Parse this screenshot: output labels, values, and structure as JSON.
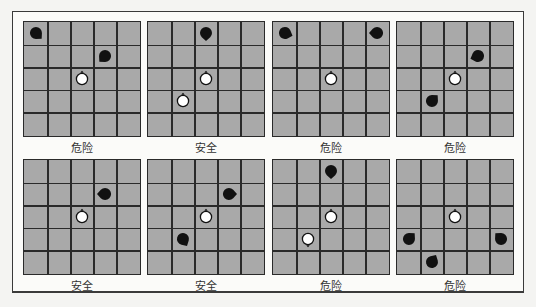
{
  "figure": {
    "grid_size": 5,
    "colors": {
      "board": "#a9a9a9",
      "grid_line": "#2a2a2a",
      "black_piece": "#111111",
      "white_piece": "#ffffff",
      "label_text": "#333333"
    },
    "panels": [
      {
        "label": "危险",
        "pieces": [
          {
            "color": "black",
            "row": 0,
            "col": 0,
            "dir": 135
          },
          {
            "color": "black",
            "row": 1,
            "col": 3,
            "dir": 225
          },
          {
            "color": "white",
            "row": 2,
            "col": 2,
            "dir": 0
          }
        ]
      },
      {
        "label": "安全",
        "pieces": [
          {
            "color": "black",
            "row": 0,
            "col": 2,
            "dir": 180
          },
          {
            "color": "white",
            "row": 2,
            "col": 2,
            "dir": 0
          },
          {
            "color": "white",
            "row": 3,
            "col": 1,
            "dir": 0
          }
        ]
      },
      {
        "label": "危险",
        "pieces": [
          {
            "color": "black",
            "row": 0,
            "col": 0,
            "dir": 110
          },
          {
            "color": "black",
            "row": 0,
            "col": 4,
            "dir": 270
          },
          {
            "color": "white",
            "row": 2,
            "col": 2,
            "dir": 0
          }
        ]
      },
      {
        "label": "危险",
        "pieces": [
          {
            "color": "black",
            "row": 1,
            "col": 3,
            "dir": 250
          },
          {
            "color": "white",
            "row": 2,
            "col": 2,
            "dir": 0
          },
          {
            "color": "black",
            "row": 3,
            "col": 1,
            "dir": 45
          }
        ]
      },
      {
        "label": "安全",
        "pieces": [
          {
            "color": "black",
            "row": 1,
            "col": 3,
            "dir": 270
          },
          {
            "color": "white",
            "row": 2,
            "col": 2,
            "dir": 0
          }
        ]
      },
      {
        "label": "安全",
        "pieces": [
          {
            "color": "black",
            "row": 1,
            "col": 3,
            "dir": 90
          },
          {
            "color": "white",
            "row": 2,
            "col": 2,
            "dir": 0
          },
          {
            "color": "black",
            "row": 3,
            "col": 1,
            "dir": 150
          }
        ]
      },
      {
        "label": "危险",
        "pieces": [
          {
            "color": "black",
            "row": 0,
            "col": 2,
            "dir": 180
          },
          {
            "color": "white",
            "row": 2,
            "col": 2,
            "dir": 0
          },
          {
            "color": "white",
            "row": 3,
            "col": 1,
            "dir": 180
          }
        ]
      },
      {
        "label": "危险",
        "pieces": [
          {
            "color": "white",
            "row": 2,
            "col": 2,
            "dir": 0
          },
          {
            "color": "black",
            "row": 3,
            "col": 0,
            "dir": 45
          },
          {
            "color": "black",
            "row": 3,
            "col": 4,
            "dir": 315
          },
          {
            "color": "black",
            "row": 4,
            "col": 1,
            "dir": 30
          }
        ]
      }
    ]
  }
}
